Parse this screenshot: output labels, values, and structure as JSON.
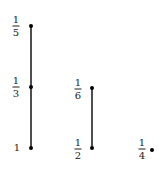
{
  "diagram": {
    "type": "hasse-diagram",
    "nodes": [
      {
        "id": "n1",
        "label": "1",
        "x": 31,
        "y": 148,
        "lx": 17,
        "ly": 148
      },
      {
        "id": "n1_3",
        "label_num": "1",
        "label_den": "3",
        "x": 31,
        "y": 87,
        "lx": 16,
        "ly": 87
      },
      {
        "id": "n1_5",
        "label_num": "1",
        "label_den": "5",
        "x": 31,
        "y": 26,
        "lx": 16,
        "ly": 26
      },
      {
        "id": "n1_2",
        "label_num": "1",
        "label_den": "2",
        "x": 92,
        "y": 148,
        "lx": 78,
        "ly": 149
      },
      {
        "id": "n1_6",
        "label_num": "1",
        "label_den": "6",
        "x": 92,
        "y": 88,
        "lx": 78,
        "ly": 89
      },
      {
        "id": "n1_4",
        "label_num": "1",
        "label_den": "4",
        "x": 152,
        "y": 150,
        "lx": 142,
        "ly": 149
      }
    ],
    "edges": [
      {
        "from": "n1",
        "to": "n1_3"
      },
      {
        "from": "n1_3",
        "to": "n1_5"
      },
      {
        "from": "n1_2",
        "to": "n1_6"
      }
    ],
    "colors": {
      "line": "#222222",
      "node": "#111111"
    }
  }
}
